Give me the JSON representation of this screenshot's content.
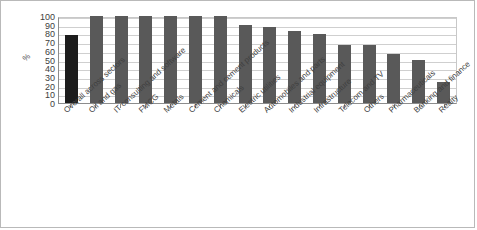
{
  "chart_data": {
    "type": "bar",
    "title": "",
    "subtitle": "",
    "xlabel": "",
    "ylabel": "%",
    "ylim": [
      0,
      100
    ],
    "y_ticks": [
      0,
      10,
      20,
      30,
      40,
      50,
      60,
      70,
      80,
      90,
      100
    ],
    "grid": true,
    "legend": false,
    "legend_position": "none",
    "orientation": "vertical",
    "categories": [
      "Overall across sectors",
      "Oil and gas",
      "IT consulting and software",
      "FMCG",
      "Metals",
      "Cement and cement products",
      "Chemicals",
      "Electric utilities",
      "Automobiles and parts",
      "Industrial equipment",
      "Infrastructure",
      "Telecom and TV",
      "Others",
      "Pharmaceuticals",
      "Banking and finance",
      "Realty"
    ],
    "values": [
      78,
      100,
      100,
      100,
      100,
      100,
      100,
      90,
      87,
      83,
      79,
      67,
      67,
      56,
      50,
      24
    ],
    "highlight_index": 0,
    "colors": {
      "bar": "#595959",
      "bar_highlight": "#1c1c1c",
      "gridline": "#cfcfcf",
      "axis": "#8c8c8c",
      "background": "#ffffff",
      "border": "#b9b9b9",
      "text": "#3f3f3f"
    }
  }
}
